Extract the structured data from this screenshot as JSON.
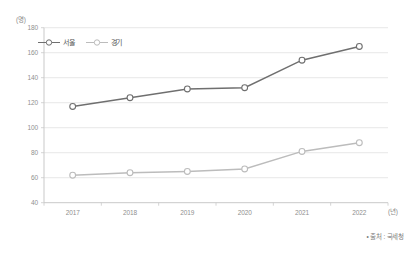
{
  "chart_data": {
    "type": "line",
    "title": "",
    "xlabel": "(년)",
    "ylabel": "(명)",
    "unit_top": "(명)",
    "unit_right": "(년)",
    "categories": [
      "2017",
      "2018",
      "2019",
      "2020",
      "2021",
      "2022"
    ],
    "series": [
      {
        "name": "서울",
        "color": "#6f6f6f",
        "values": [
          117,
          124,
          131,
          132,
          154,
          165
        ]
      },
      {
        "name": "경기",
        "color": "#bcbcbc",
        "values": [
          62,
          64,
          65,
          67,
          81,
          88
        ]
      }
    ],
    "ylim": [
      40,
      180
    ],
    "yticks": [
      "180",
      "160",
      "140",
      "120",
      "100",
      "80",
      "60",
      "40"
    ],
    "grid": true,
    "legend_position": "top-left"
  },
  "source": {
    "note": "• 출처 : 국세청"
  },
  "colors": {
    "seoul_line": "#6f6f6f",
    "gyeonggi_line": "#bcbcbc",
    "axis": "#c9c9c9",
    "grid": "#dedede",
    "tick_text": "#8f8f8f"
  }
}
